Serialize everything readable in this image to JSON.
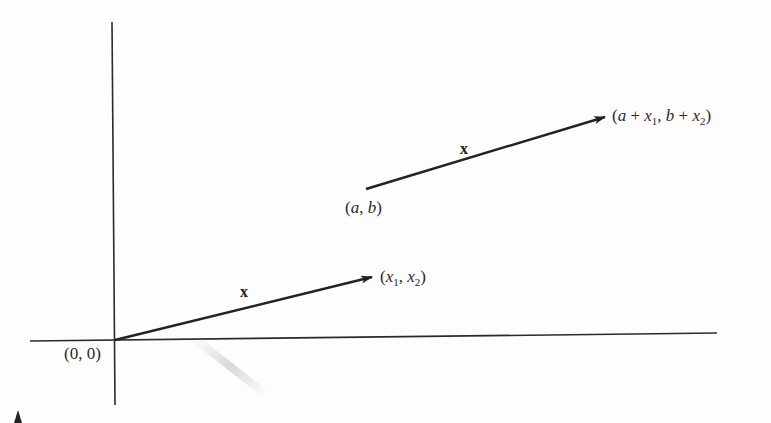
{
  "figure": {
    "type": "vector-translation-diagram",
    "axes": {
      "origin_label": "(0, 0)"
    },
    "vectors": [
      {
        "name": "x",
        "from_label": "(0, 0)",
        "to_label": "(x1, x2)"
      },
      {
        "name": "x",
        "from_label": "(a, b)",
        "to_label": "(a + x1, b + x2)"
      }
    ],
    "labels": {
      "origin": "(0, 0)",
      "tip1": "(x1, x2)",
      "tail2": "(a, b)",
      "tip2": "(a + x1, b + x2)",
      "vec1": "x",
      "vec2": "x"
    },
    "colors": {
      "ink": "#222222",
      "paper": "#fdfdfd"
    }
  }
}
